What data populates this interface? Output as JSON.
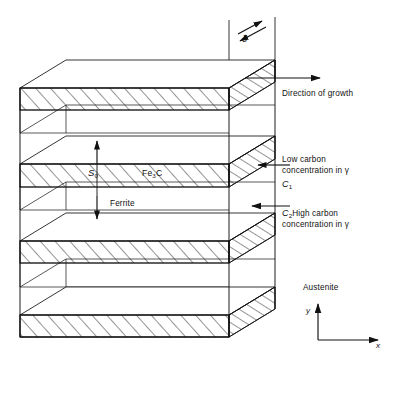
{
  "diagram": {
    "type": "schematic-3d-block",
    "colors": {
      "line": "#111111",
      "hatch": "#111111",
      "background": "#ffffff"
    },
    "labels": {
      "delta": "δ",
      "direction_of_growth": "Direction of growth",
      "low_carbon_line1": "Low carbon",
      "low_carbon_line2": "concentration in γ",
      "c1": "C",
      "c1_sub": "1",
      "c2": "C",
      "c2_sub": "2",
      "high_carbon_line1": "High carbon",
      "high_carbon_line2": "concentration in γ",
      "austenite": "Austenite",
      "s0": "S",
      "s0_sub": "0",
      "cementite": "Fe",
      "cementite_sub": "3",
      "cementite_tail": "C",
      "ferrite": "Ferrite",
      "axis_y": "y",
      "axis_x": "x"
    },
    "geometry": {
      "front_left_x": 20,
      "front_right_x": 229,
      "back_offset_x": 46,
      "back_offset_y": -28,
      "bands": [
        {
          "name": "cementite-lamella-1",
          "top": 88,
          "bottom": 110
        },
        {
          "name": "cementite-lamella-2",
          "top": 164,
          "bottom": 187
        },
        {
          "name": "cementite-lamella-3",
          "top": 241,
          "bottom": 263
        },
        {
          "name": "cementite-lamella-4",
          "top": 315,
          "bottom": 337
        }
      ],
      "delta_left_x": 229,
      "delta_right_x": 275,
      "spacing_arrow": {
        "x": 97,
        "top": 140,
        "bottom": 219
      }
    }
  }
}
